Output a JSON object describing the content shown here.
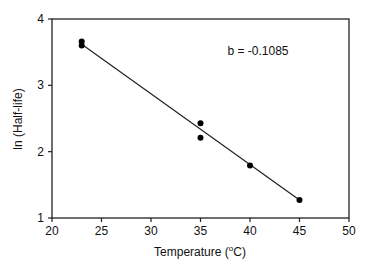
{
  "chart_data": {
    "type": "scatter",
    "title": "",
    "xlabel": "Temperature (°C)",
    "ylabel": "ln (Half-life)",
    "xlim": [
      20,
      50
    ],
    "ylim": [
      1,
      4
    ],
    "x_ticks": [
      20,
      25,
      30,
      35,
      40,
      45,
      50
    ],
    "y_ticks": [
      1,
      2,
      3,
      4
    ],
    "grid": false,
    "legend": null,
    "series": [
      {
        "name": "data",
        "type": "scatter",
        "x": [
          23,
          23,
          35,
          35,
          40,
          45
        ],
        "y": [
          3.66,
          3.6,
          2.43,
          2.21,
          1.79,
          1.27
        ]
      },
      {
        "name": "regression line",
        "type": "line",
        "x": [
          23,
          45
        ],
        "y": [
          3.62,
          1.27
        ]
      }
    ],
    "annotations": [
      {
        "text": "b = -0.1085",
        "x": 38.5,
        "y": 3.5
      }
    ]
  },
  "labels": {
    "xlabel_main": "Temperature (",
    "xlabel_sup": "o",
    "xlabel_end": "C)",
    "ylabel": "ln (Half-life)",
    "slope": "b = -0.1085"
  }
}
